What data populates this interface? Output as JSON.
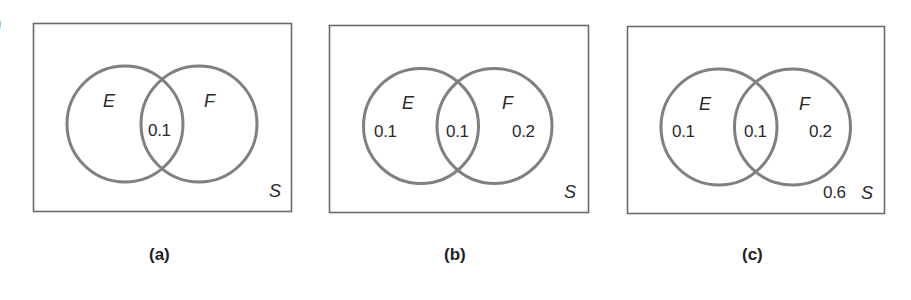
{
  "figure": {
    "edge_glyph": ")",
    "colors": {
      "circle_stroke": "#808080",
      "rect_stroke": "#6a6a6a",
      "text": "#2a2a2a",
      "background": "#ffffff"
    },
    "panels": [
      {
        "caption": "(a)",
        "universe_label": "S",
        "set_e_label": "E",
        "set_f_label": "F",
        "region_e_only": "",
        "region_intersection": "0.1",
        "region_f_only": "",
        "region_outside": ""
      },
      {
        "caption": "(b)",
        "universe_label": "S",
        "set_e_label": "E",
        "set_f_label": "F",
        "region_e_only": "0.1",
        "region_intersection": "0.1",
        "region_f_only": "0.2",
        "region_outside": ""
      },
      {
        "caption": "(c)",
        "universe_label": "S",
        "set_e_label": "E",
        "set_f_label": "F",
        "region_e_only": "0.1",
        "region_intersection": "0.1",
        "region_f_only": "0.2",
        "region_outside": "0.6"
      }
    ]
  }
}
